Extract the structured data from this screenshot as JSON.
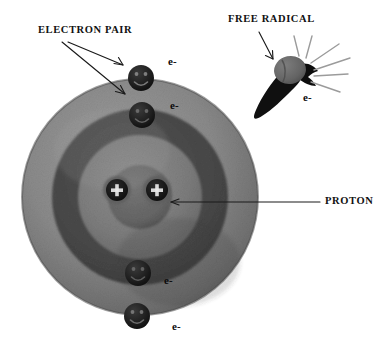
{
  "diagram": {
    "title_labels": [
      {
        "id": "electron-pair",
        "text": "ELECTRON PAIR",
        "x": 38,
        "y": 30
      },
      {
        "id": "free-radical",
        "text": "FREE RADICAL",
        "x": 228,
        "y": 16
      },
      {
        "id": "proton",
        "text": "PROTON",
        "x": 325,
        "y": 198
      }
    ],
    "electron_labels": [
      {
        "id": "electron-label-1",
        "text": "e-",
        "x": 168,
        "y": 61
      },
      {
        "id": "electron-label-2",
        "text": "e-",
        "x": 170,
        "y": 104
      },
      {
        "id": "electron-label-3",
        "text": "e-",
        "x": 166,
        "y": 278
      },
      {
        "id": "electron-label-4",
        "text": "e-",
        "x": 172,
        "y": 325
      },
      {
        "id": "electron-label-radical",
        "text": "e-",
        "x": 303,
        "y": 96
      }
    ],
    "electrons": [
      {
        "id": "electron-shell-outer-top",
        "cx": 141,
        "cy": 78,
        "r": 13
      },
      {
        "id": "electron-shell-inner-top",
        "cx": 142,
        "cy": 115,
        "r": 13
      },
      {
        "id": "electron-shell-inner-bottom",
        "cx": 138,
        "cy": 273,
        "r": 13
      },
      {
        "id": "electron-shell-outer-bottom",
        "cx": 137,
        "cy": 316,
        "r": 13
      }
    ],
    "protons": [
      {
        "id": "proton-left",
        "cx": 117,
        "cy": 190,
        "r": 13
      },
      {
        "id": "proton-right",
        "cx": 157,
        "cy": 190,
        "r": 13
      }
    ],
    "atom": {
      "cx": 140,
      "cy": 197,
      "outer_r": 118,
      "ring_r": 88,
      "inner_r": 62,
      "nucleus_r": 32
    },
    "free_radical": {
      "head_cx": 291,
      "head_cy": 70,
      "spark_count": 6
    },
    "colors": {
      "atom_outer": "#8c8c8c",
      "atom_ring_dark": "#4a4a4a",
      "atom_inner": "#7e7e7e",
      "nucleus": "#6a6a6a",
      "particle_dark": "#1b1b1b",
      "label_text": "#111111",
      "leader_line": "#1a1a1a",
      "spark_line": "#9a9a9a",
      "background": "#ffffff"
    }
  }
}
